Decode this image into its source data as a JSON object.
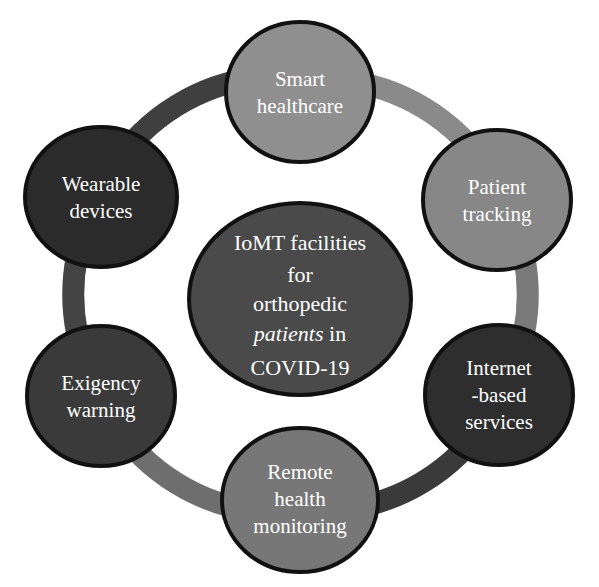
{
  "diagram": {
    "type": "radial-cycle",
    "title_text": "IoMT facilities for orthopedic patients in COVID-19",
    "background_color": "#ffffff",
    "outline_color": "#111111",
    "label_color": "#ffffff",
    "center": {
      "name": "center-node",
      "fill": "#4a4a4a",
      "lines": [
        {
          "text": "IoMT facilities",
          "style": "normal"
        },
        {
          "text": "for",
          "style": "normal"
        },
        {
          "text": "orthopedic",
          "style": "italic"
        },
        {
          "text": "patients in",
          "style": "mixed-italic"
        },
        {
          "text": "COVID-19",
          "style": "normal"
        }
      ],
      "plain_text": "IoMT facilities for orthopedic patients in COVID-19"
    },
    "nodes": [
      {
        "id": "smart-healthcare",
        "label": "Smart healthcare",
        "lines": [
          "Smart",
          "healthcare"
        ],
        "fill": "#8f8f8f",
        "position": "top"
      },
      {
        "id": "patient-tracking",
        "label": "Patient tracking",
        "lines": [
          "Patient",
          "tracking"
        ],
        "fill": "#878787",
        "position": "upper-right"
      },
      {
        "id": "internet-based-services",
        "label": "Internet -based services",
        "lines": [
          "Internet",
          "-based",
          "services"
        ],
        "fill": "#2e2e2e",
        "position": "lower-right"
      },
      {
        "id": "remote-health-monitoring",
        "label": "Remote health monitoring",
        "lines": [
          "Remote",
          "health",
          "monitoring"
        ],
        "fill": "#777777",
        "position": "bottom"
      },
      {
        "id": "exigency-warning",
        "label": "Exigency warning",
        "lines": [
          "Exigency",
          "warning"
        ],
        "fill": "#3a3a3a",
        "position": "lower-left"
      },
      {
        "id": "wearable-devices",
        "label": "Wearable devices",
        "lines": [
          "Wearable",
          "devices"
        ],
        "fill": "#2b2b2b",
        "position": "upper-left"
      }
    ],
    "connectors": [
      {
        "id": "arc-wearable-smart",
        "from": "wearable-devices",
        "to": "smart-healthcare",
        "color": "#3f3f3f"
      },
      {
        "id": "arc-smart-patient",
        "from": "smart-healthcare",
        "to": "patient-tracking",
        "color": "#8a8a8a"
      },
      {
        "id": "arc-patient-internet",
        "from": "patient-tracking",
        "to": "internet-based-services",
        "color": "#7a7a7a"
      },
      {
        "id": "arc-internet-remote",
        "from": "internet-based-services",
        "to": "remote-health-monitoring",
        "color": "#3a3a3a"
      },
      {
        "id": "arc-remote-exigency",
        "from": "remote-health-monitoring",
        "to": "exigency-warning",
        "color": "#6e6e6e"
      },
      {
        "id": "arc-exigency-wearable",
        "from": "exigency-warning",
        "to": "wearable-devices",
        "color": "#444444"
      }
    ]
  }
}
